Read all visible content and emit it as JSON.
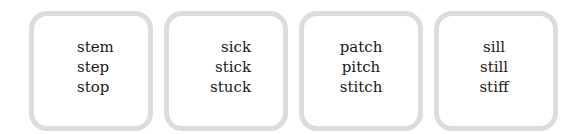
{
  "boxes": [
    {
      "words": [
        "stem",
        "step",
        "stop"
      ],
      "align": "left"
    },
    {
      "words": [
        "sick",
        "stick",
        "stuck"
      ],
      "align": "right"
    },
    {
      "words": [
        "patch",
        "pitch",
        "stitch"
      ],
      "align": "center"
    },
    {
      "words": [
        "sill",
        "still",
        "stiff"
      ],
      "align": "center"
    }
  ],
  "colors": {
    "border": "#dcdcdc",
    "text": "#1a1a1a",
    "background": "#ffffff"
  }
}
